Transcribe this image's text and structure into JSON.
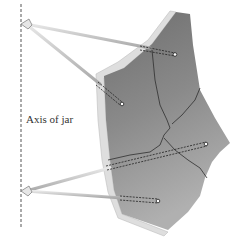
{
  "figure": {
    "axis_label": "Axis of jar",
    "elements": [
      "vertical dashed axis line",
      "pottery shard with cracks",
      "four measuring rods with dashed insertion ends",
      "two pivot joints on axis"
    ]
  },
  "colors": {
    "shard_top": "#707070",
    "shard_bottom": "#aaaaaa",
    "rim": "#dcdcdc",
    "rod": "#c9c9c9",
    "crack": "#333333",
    "axis": "#555555"
  }
}
